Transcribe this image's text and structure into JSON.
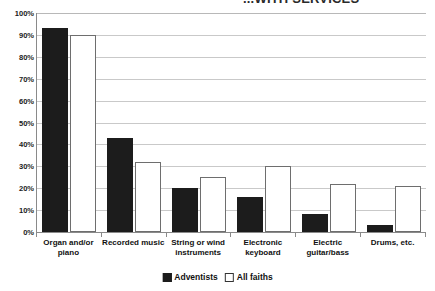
{
  "chart_data": {
    "type": "bar",
    "title": "...WITH SERVICES",
    "title_note": "title is cropped off at the top edge of the screenshot",
    "categories": [
      "Organ and/or piano",
      "Recorded music",
      "String or wind instruments",
      "Electronic keyboard",
      "Electric guitar/bass",
      "Drums, etc."
    ],
    "series": [
      {
        "name": "Adventists",
        "values": [
          93,
          43,
          20,
          16,
          8,
          3
        ],
        "color": "#1c1c1c"
      },
      {
        "name": "All faiths",
        "values": [
          90,
          32,
          25,
          30,
          22,
          21
        ],
        "color": "#ffffff"
      }
    ],
    "xlabel": "",
    "ylabel": "",
    "ylim": [
      0,
      100
    ],
    "ytick_values": [
      0,
      10,
      20,
      30,
      40,
      50,
      60,
      70,
      80,
      90,
      100
    ],
    "ytick_labels": [
      "0%",
      "10%",
      "20%",
      "30%",
      "40%",
      "50%",
      "60%",
      "70%",
      "80%",
      "90%",
      "100%"
    ],
    "grid": true,
    "legend_position": "bottom"
  },
  "legend": {
    "items": [
      {
        "label": "Adventists",
        "swatch": "filled-square"
      },
      {
        "label": "All faiths",
        "swatch": "hollow-square"
      }
    ]
  }
}
